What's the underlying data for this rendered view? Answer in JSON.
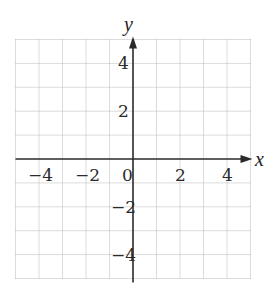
{
  "chart_data": {
    "type": "scatter",
    "title": "",
    "xlabel": "x",
    "ylabel": "y",
    "xlim": [
      -5,
      5
    ],
    "ylim": [
      -5,
      5
    ],
    "grid": true,
    "grid_step": 1,
    "x_ticks": [
      {
        "value": -4,
        "label": "−4"
      },
      {
        "value": -2,
        "label": "−2"
      },
      {
        "value": 0,
        "label": "0"
      },
      {
        "value": 2,
        "label": "2"
      },
      {
        "value": 4,
        "label": "4"
      }
    ],
    "y_ticks": [
      {
        "value": 4,
        "label": "4"
      },
      {
        "value": 2,
        "label": "2"
      },
      {
        "value": -2,
        "label": "−2"
      },
      {
        "value": -4,
        "label": "−4"
      }
    ],
    "series": [],
    "legend": null
  },
  "colors": {
    "grid": "#b8b8b8",
    "axis": "#2a2a2a",
    "background": "#ffffff"
  }
}
